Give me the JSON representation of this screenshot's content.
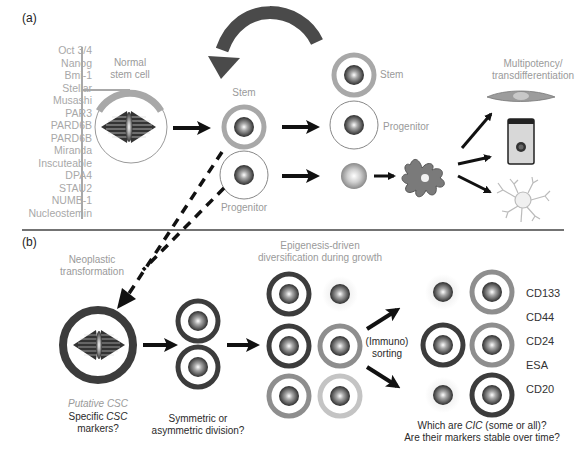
{
  "panel_a": {
    "label": "(a)",
    "markers": [
      "Oct 3/4",
      "Nanog",
      "Bmi-1",
      "Stellar",
      "Musashi",
      "PAR3",
      "PARD6B",
      "PARD6B",
      "Miranda",
      "Inscuteable",
      "DPA4",
      "STAU2",
      "NUMB-1",
      "Nucleostemin"
    ],
    "normal_stem_cell": [
      "Normal",
      "stem cell"
    ],
    "stem_label_1": "Stem",
    "progenitor_label_1": "Progenitor",
    "stem_label_2": "Stem",
    "progenitor_label_2": "Progenitor",
    "multipotency": [
      "Multipotency/",
      "transdifferentiation"
    ]
  },
  "panel_b": {
    "label": "(b)",
    "neoplastic": [
      "Neoplastic",
      "transformation"
    ],
    "putative_csc": "Putative CSC",
    "specific_markers": [
      "Specific ",
      "CSC",
      " markers?"
    ],
    "division": [
      "Symmetric or",
      "asymmetric division?"
    ],
    "epigenesis": [
      "Epigenesis-driven",
      "diversification during growth"
    ],
    "sorting": [
      "(Immuno)",
      "sorting"
    ],
    "cd_markers": [
      "CD133",
      "CD44",
      "CD24",
      "ESA",
      "CD20"
    ],
    "question": [
      "Which are ",
      "CIC",
      " (some or all)?",
      "Are their markers stable over time?"
    ]
  },
  "colors": {
    "dark_ring": "#3c3c3c",
    "medium_ring": "#8e8e8e",
    "light_ring": "#c4c4c4",
    "text_gray": "#9a9a9a",
    "arrow": "#111111",
    "curved_arrow": "#4a4a4a"
  }
}
